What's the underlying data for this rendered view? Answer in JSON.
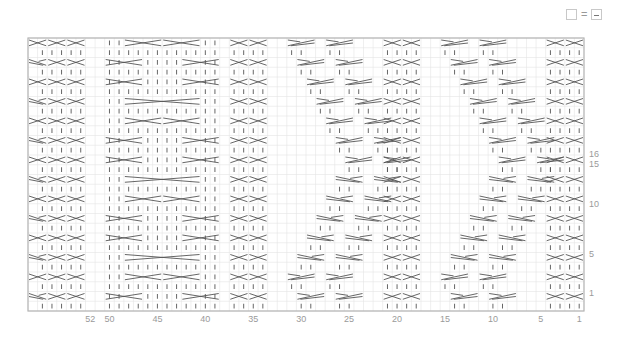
{
  "legend": {
    "items": [
      {
        "symbol": "empty-square",
        "equals": "=",
        "meaning_symbol": "dash-square"
      }
    ]
  },
  "chart_data": {
    "type": "table",
    "grid": {
      "columns": 58,
      "rows": 28,
      "left": 28,
      "top": 38,
      "cell_w": 9.586,
      "cell_h": 9.75,
      "line_color": "#e4e4e4",
      "border_color": "#b5b5b5",
      "symbol_color": "#555555"
    },
    "column_labels": [
      {
        "label": "1",
        "col": 1
      },
      {
        "label": "5",
        "col": 5
      },
      {
        "label": "10",
        "col": 10
      },
      {
        "label": "15",
        "col": 15
      },
      {
        "label": "20",
        "col": 20
      },
      {
        "label": "25",
        "col": 25
      },
      {
        "label": "30",
        "col": 30
      },
      {
        "label": "35",
        "col": 35
      },
      {
        "label": "40",
        "col": 40
      },
      {
        "label": "45",
        "col": 45
      },
      {
        "label": "50",
        "col": 50
      },
      {
        "label": "52",
        "col": 52
      }
    ],
    "row_labels": [
      {
        "label": "1",
        "y": 293
      },
      {
        "label": "5",
        "y": 254
      },
      {
        "label": "10",
        "y": 204
      },
      {
        "label": "15",
        "y": 164
      },
      {
        "label": "16",
        "y": 154
      }
    ],
    "symbols": {
      "X": "2-over-2 cross (cable)",
      "|": "knit stitch",
      "L": "left-leaning cross 2 sts",
      "R": "right-leaning cross 2 sts",
      ".": "no stitch / blank"
    },
    "panels": [
      {
        "name": "edge-left",
        "cols": [
          57,
          58
        ]
      },
      {
        "name": "cable-4-left",
        "cols": [
          53,
          56
        ]
      },
      {
        "name": "big-cable",
        "cols": [
          39,
          50
        ]
      },
      {
        "name": "cable-4-mid-left",
        "cols": [
          34,
          37
        ]
      },
      {
        "name": "travel-cable-a",
        "cols": [
          22,
          32
        ]
      },
      {
        "name": "cable-4-mid-right",
        "cols": [
          18,
          21
        ]
      },
      {
        "name": "travel-cable-b",
        "cols": [
          6,
          16
        ]
      },
      {
        "name": "cable-4-right",
        "cols": [
          1,
          4
        ]
      }
    ]
  }
}
